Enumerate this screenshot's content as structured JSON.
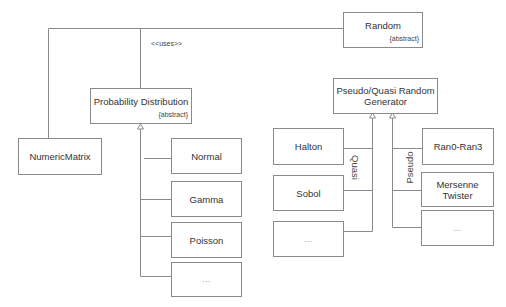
{
  "diagram": {
    "type": "UML class diagram",
    "colors": {
      "line": "#8a8a8a",
      "box_border": "#8a8a8a",
      "text": "#333333",
      "background": "#ffffff"
    },
    "uses_label": "<<uses>>",
    "classes": {
      "random": {
        "name": "Random",
        "stereotype": "{abstract}"
      },
      "numeric_matrix": {
        "name": "NumericMatrix"
      },
      "probability_distribution": {
        "name": "Probability Distribution",
        "stereotype": "{abstract}"
      },
      "generator": {
        "name": "Pseudo/Quasi Random Generator",
        "line1": "Pseudo/Quasi Random",
        "line2": "Generator"
      }
    },
    "distributions": [
      {
        "name": "Normal"
      },
      {
        "name": "Gamma"
      },
      {
        "name": "Poisson"
      },
      {
        "name": "..."
      }
    ],
    "quasi": {
      "group_label": "Quasi",
      "items": [
        {
          "name": "Halton"
        },
        {
          "name": "Sobol"
        },
        {
          "name": "..."
        }
      ]
    },
    "pseudo": {
      "group_label": "Pseudo",
      "items": [
        {
          "name": "Ran0-Ran3"
        },
        {
          "name": "Mersenne Twister",
          "line1": "Mersenne",
          "line2": "Twister"
        },
        {
          "name": "..."
        }
      ]
    }
  }
}
